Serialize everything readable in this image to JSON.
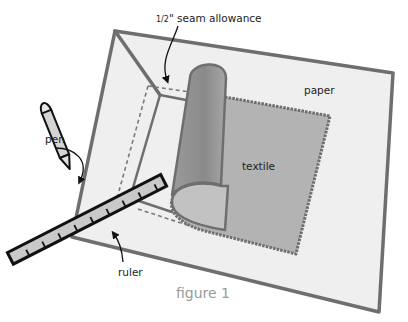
{
  "diagram": {
    "caption": "figure 1",
    "labels": {
      "seam_allowance": "1/2\" seam allowance",
      "seam_fraction": "1/2",
      "seam_rest": "\" seam allowance",
      "paper": "paper",
      "textile": "textile",
      "pen": "pen",
      "ruler": "ruler"
    },
    "colors": {
      "paper_fill": "#efefef",
      "paper_edge": "#6e6e6e",
      "textile_fill": "#b3b3b3",
      "textile_roll": "#8e8e8e",
      "ruler_fill": "#c9c9c9",
      "outline": "#111111",
      "caption": "#9a9a9a"
    }
  }
}
